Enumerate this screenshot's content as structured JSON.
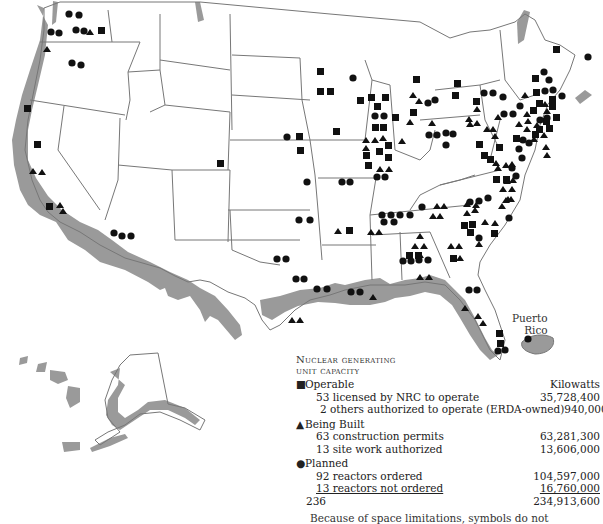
{
  "map": {
    "title": "Nuclear generating unit capacity",
    "territory_label_1": "Puerto",
    "territory_label_2": "Rico",
    "symbols": {
      "square": "Operable",
      "triangle": "Being Built",
      "circle": "Planned"
    }
  },
  "legend": {
    "title_line1": "Nuclear generating",
    "title_line2": "unit capacity",
    "units_header": "Kilowatts",
    "categories": [
      {
        "symbol": "■",
        "label": "Operable",
        "items": [
          {
            "label": "53 licensed by NRC to operate",
            "value": "35,728,400"
          },
          {
            "label": "2 others authorized to operate (ERDA-owned)",
            "value": "940,000"
          }
        ]
      },
      {
        "symbol": "▲",
        "label": "Being Built",
        "items": [
          {
            "label": "63 construction permits",
            "value": "63,281,300"
          },
          {
            "label": "13 site work authorized",
            "value": "13,606,000"
          }
        ]
      },
      {
        "symbol": "●",
        "label": "Planned",
        "items": [
          {
            "label": "92 reactors ordered",
            "value": "104,597,000"
          },
          {
            "label": "13 reactors not ordered",
            "value": "16,760,000"
          }
        ]
      }
    ],
    "total_count": "236",
    "total_value": "234,913,600",
    "footnote": "Because of space limitations, symbols do not"
  }
}
